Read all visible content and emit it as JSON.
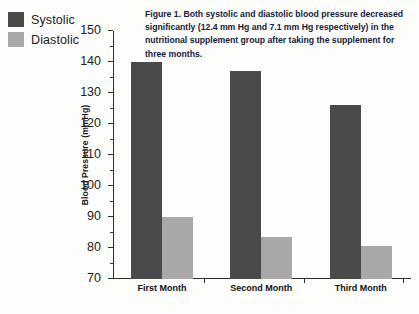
{
  "legend": {
    "items": [
      {
        "label": "Systolic",
        "color": "#4a4a4a",
        "icon": "legend-swatch-systolic"
      },
      {
        "label": "Diastolic",
        "color": "#a8a8a8",
        "icon": "legend-swatch-diastolic"
      }
    ]
  },
  "caption": {
    "text": "Figure 1. Both systolic and diastolic blood pressure decreased significantly (12.4 mm Hg and 7.1 mm Hg respectively) in the nutritional supplement group after taking the supplement for three months."
  },
  "chart_data": {
    "type": "bar",
    "title": "",
    "xlabel": "",
    "ylabel": "Blood Pressure (mmHg)",
    "ylim": [
      70,
      150
    ],
    "ytick_labels": [
      "70",
      "80",
      "90",
      "100",
      "110",
      "120",
      "130",
      "140",
      "150"
    ],
    "ytick_values": [
      70,
      80,
      90,
      100,
      110,
      120,
      130,
      140,
      150
    ],
    "minor_tick_step": 5,
    "grid": false,
    "legend_position": "top-left-outside",
    "categories": [
      "First Month",
      "Second Month",
      "Third Month"
    ],
    "series": [
      {
        "name": "Systolic",
        "color": "#4a4a4a",
        "values": [
          140,
          137,
          126
        ]
      },
      {
        "name": "Diastolic",
        "color": "#a8a8a8",
        "values": [
          90,
          83.5,
          80.5
        ]
      }
    ]
  }
}
